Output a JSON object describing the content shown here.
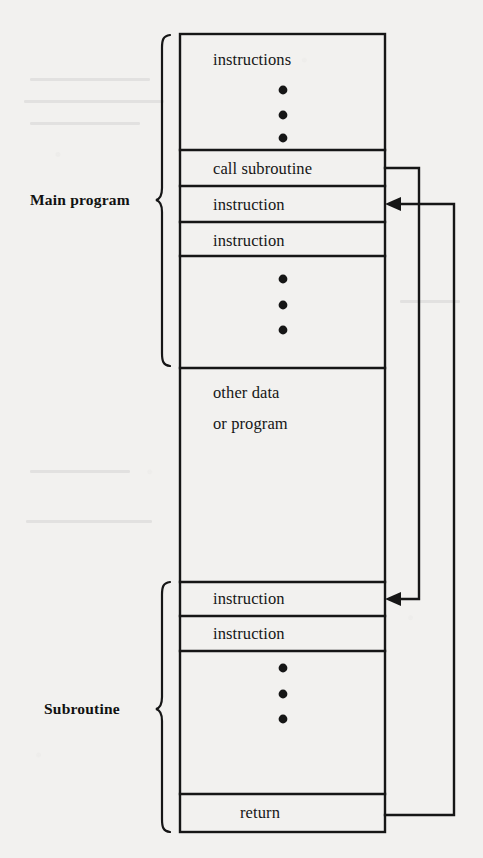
{
  "diagram": {
    "type": "memory-map-flow",
    "canvas": {
      "width": 483,
      "height": 858
    },
    "colors": {
      "background": "#f2f1ef",
      "stroke": "#161616",
      "text": "#161616",
      "label": "#111111"
    },
    "memory_box": {
      "x": 180,
      "y": 34,
      "width": 205,
      "height": 798
    },
    "groups": [
      {
        "name": "main-program",
        "label": "Main program",
        "label_x": 30,
        "label_y": 200,
        "brace_top": 35,
        "brace_bottom": 366
      },
      {
        "name": "subroutine",
        "label": "Subroutine",
        "label_x": 44,
        "label_y": 709,
        "brace_top": 582,
        "brace_bottom": 832
      }
    ],
    "rows": [
      {
        "name": "instructions-block",
        "label": "instructions",
        "top": 34,
        "bottom": 150,
        "text_y": 50,
        "dots": 3,
        "dots_y": [
          90,
          115,
          138
        ]
      },
      {
        "name": "call-subroutine-row",
        "label": "call subroutine",
        "top": 150,
        "bottom": 186,
        "text_y": 159,
        "dots": 0,
        "dots_y": []
      },
      {
        "name": "instruction-row-1",
        "label": "instruction",
        "top": 186,
        "bottom": 222,
        "text_y": 195,
        "dots": 0,
        "dots_y": []
      },
      {
        "name": "instruction-row-2",
        "label": "instruction",
        "top": 222,
        "bottom": 256,
        "text_y": 231,
        "dots": 0,
        "dots_y": []
      },
      {
        "name": "main-dots-block",
        "label": "",
        "top": 256,
        "bottom": 368,
        "text_y": 0,
        "dots": 3,
        "dots_y": [
          279,
          305,
          330
        ]
      },
      {
        "name": "other-data-block",
        "label": "other data",
        "top": 368,
        "bottom": 582,
        "text_y": 383,
        "dots": 0,
        "dots_y": [],
        "label2": "or program",
        "text2_y": 414
      },
      {
        "name": "sub-instruction-1",
        "label": "instruction",
        "top": 582,
        "bottom": 616,
        "text_y": 589,
        "dots": 0,
        "dots_y": []
      },
      {
        "name": "sub-instruction-2",
        "label": "instruction",
        "top": 616,
        "bottom": 651,
        "text_y": 624,
        "dots": 0,
        "dots_y": []
      },
      {
        "name": "sub-dots-block",
        "label": "",
        "top": 651,
        "bottom": 794,
        "text_y": 0,
        "dots": 3,
        "dots_y": [
          668,
          694,
          719
        ]
      },
      {
        "name": "return-row",
        "label": "return",
        "top": 794,
        "bottom": 832,
        "text_y": 803,
        "dots": 0,
        "dots_y": []
      }
    ],
    "connectors": [
      {
        "name": "call-jump-connector",
        "from": "call-subroutine-row",
        "to": "sub-instruction-1",
        "from_y": 168,
        "to_y": 599,
        "bus_x": 419,
        "arrow_at": "sub-instruction-1"
      },
      {
        "name": "return-jump-connector",
        "from": "return-row",
        "to": "instruction-row-1",
        "from_y": 815,
        "to_y": 204,
        "bus_x": 454,
        "arrow_at": "instruction-row-1"
      }
    ]
  }
}
